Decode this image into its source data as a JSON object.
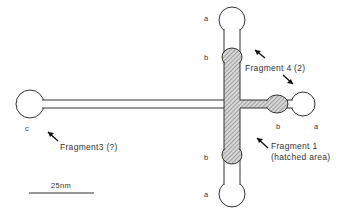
{
  "diagram": {
    "type": "schematic of cross-shaped molecule with fragments",
    "labels": {
      "top_a": "a",
      "top_b": "b",
      "bottom_b": "b",
      "bottom_a": "a",
      "right_b": "b",
      "right_a": "a",
      "left_c": "c"
    },
    "fragments": {
      "fragment4": "Fragment 4 (2)",
      "fragment3": "Fragment3 (?)",
      "fragment1_line1": "Fragment 1",
      "fragment1_line2": "(hatched area)"
    },
    "scale_bar": {
      "label": "25nm"
    },
    "colors": {
      "line": "#333333",
      "hatch": "#9a9a9a",
      "background": "#ffffff"
    }
  }
}
